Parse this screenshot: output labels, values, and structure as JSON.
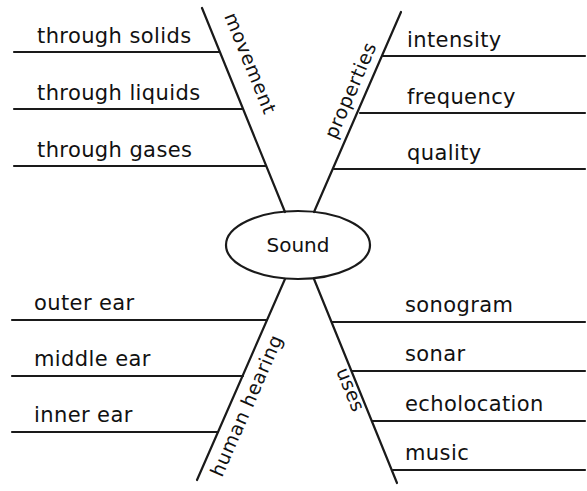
{
  "diagram": {
    "type": "spider-map",
    "center": {
      "label": "Sound"
    },
    "branches": [
      {
        "label": "movement",
        "position": "top-left",
        "details": [
          "through solids",
          "through liquids",
          "through gases"
        ]
      },
      {
        "label": "properties",
        "position": "top-right",
        "details": [
          "intensity",
          "frequency",
          "quality"
        ]
      },
      {
        "label": "human hearing",
        "position": "bottom-left",
        "details": [
          "outer ear",
          "middle ear",
          "inner ear"
        ]
      },
      {
        "label": "uses",
        "position": "bottom-right",
        "details": [
          "sonogram",
          "sonar",
          "echolocation",
          "music"
        ]
      }
    ]
  },
  "colors": {
    "ink": "#111111",
    "background": "#ffffff"
  }
}
